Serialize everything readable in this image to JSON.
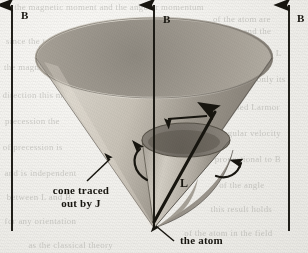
{
  "figure": {
    "background_color": "#f1f0ec",
    "ink_color": "#17150f"
  },
  "field_arrows": [
    {
      "name": "left",
      "label": "B",
      "x": 12,
      "y_top": 5,
      "y_bottom": 231
    },
    {
      "name": "center",
      "label": "B",
      "x": 154,
      "y_top": 5,
      "y_bottom": 228
    },
    {
      "name": "right",
      "label": "B",
      "x": 289,
      "y_top": 5,
      "y_bottom": 231
    }
  ],
  "labels": {
    "field_b": "B",
    "momentum_l": "L",
    "cone_line1": "cone traced",
    "cone_line2": "out by",
    "cone_symbol": "J",
    "atom": "the atom"
  },
  "cones": {
    "outer": {
      "name": "cone traced out by J",
      "apex_x": 154,
      "apex_y": 228,
      "rim_cx": 154,
      "rim_cy": 58,
      "rim_rx": 118,
      "rim_ry": 40,
      "fill_light": "#d9d5cc",
      "fill_dark": "#8d887e"
    },
    "inner": {
      "name": "inner precession cone",
      "apex_x": 154,
      "apex_y": 228,
      "rim_cx": 186,
      "rim_cy": 140,
      "rim_rx": 44,
      "rim_ry": 17,
      "fill_light": "#cfcac0",
      "fill_dark": "#7e7970"
    }
  },
  "vectors": {
    "j_vector": {
      "name": "J angular momentum vector",
      "x1": 154,
      "y1": 222,
      "x2": 215,
      "y2": 112
    },
    "precession_arrow_top": {
      "name": "precession direction arrow",
      "x1": 205,
      "y1": 116,
      "x2": 168,
      "y2": 119
    },
    "precession_arc_left": {
      "name": "left precession arc"
    },
    "precession_arc_right": {
      "name": "right precession arc"
    }
  },
  "leaders": {
    "cone_leader": {
      "name": "cone label leader line",
      "x1": 87,
      "y1": 181,
      "x2": 108,
      "y2": 161
    },
    "atom_leader": {
      "name": "atom label leader line",
      "x1": 172,
      "y1": 240,
      "x2": 155,
      "y2": 226
    }
  },
  "ghost_text": [
    {
      "text": "the magnetic moment and the angular momentum",
      "x": 18,
      "y": 2
    },
    {
      "text": "of the atom are",
      "x": 214,
      "y": 14
    },
    {
      "text": "the L vector and the",
      "x": 196,
      "y": 26
    },
    {
      "text": "since the torque is always",
      "x": 8,
      "y": 36
    },
    {
      "text": "perpendicular to L",
      "x": 212,
      "y": 48
    },
    {
      "text": "the magnitude of L cannot",
      "x": 6,
      "y": 62
    },
    {
      "text": "change but only its",
      "x": 214,
      "y": 74
    },
    {
      "text": "direction  this motion",
      "x": 4,
      "y": 90
    },
    {
      "text": "is called Larmor",
      "x": 218,
      "y": 102
    },
    {
      "text": "precession  the",
      "x": 6,
      "y": 116
    },
    {
      "text": "angular velocity",
      "x": 220,
      "y": 128
    },
    {
      "text": "of precession is",
      "x": 4,
      "y": 142
    },
    {
      "text": "proportional to B",
      "x": 216,
      "y": 154
    },
    {
      "text": "and is independent",
      "x": 6,
      "y": 168
    },
    {
      "text": "of the angle",
      "x": 220,
      "y": 180
    },
    {
      "text": "between L and B",
      "x": 8,
      "y": 192
    },
    {
      "text": "this result holds",
      "x": 212,
      "y": 204
    },
    {
      "text": "for any orientation",
      "x": 6,
      "y": 216
    },
    {
      "text": "of the atom in the field",
      "x": 186,
      "y": 228
    },
    {
      "text": "as the classical theory",
      "x": 30,
      "y": 240
    }
  ]
}
